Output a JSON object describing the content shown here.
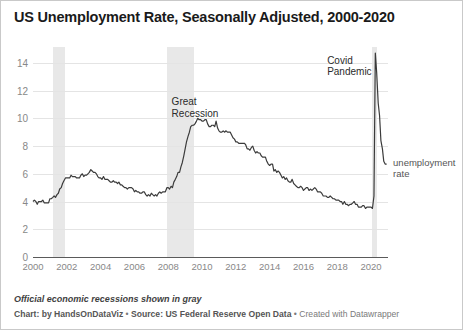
{
  "chart_data": {
    "type": "line",
    "title": "US Unemployment Rate, Seasonally Adjusted, 2000-2020",
    "xlabel": "",
    "ylabel": "",
    "xlim": [
      2000,
      2021.0
    ],
    "ylim": [
      0,
      15
    ],
    "grid": true,
    "legend_position": "right-inline",
    "y_ticks": [
      0,
      2,
      4,
      6,
      8,
      10,
      12,
      14
    ],
    "x_ticks": [
      2000,
      2002,
      2004,
      2006,
      2008,
      2010,
      2012,
      2014,
      2016,
      2018,
      2020
    ],
    "series": [
      {
        "name": "unemployment rate",
        "color": "#3b3b3b",
        "x": [
          2000.0,
          2000.08,
          2000.17,
          2000.25,
          2000.33,
          2000.42,
          2000.5,
          2000.58,
          2000.67,
          2000.75,
          2000.83,
          2000.92,
          2001.0,
          2001.08,
          2001.17,
          2001.25,
          2001.33,
          2001.42,
          2001.5,
          2001.58,
          2001.67,
          2001.75,
          2001.83,
          2001.92,
          2002.0,
          2002.08,
          2002.17,
          2002.25,
          2002.33,
          2002.42,
          2002.5,
          2002.58,
          2002.67,
          2002.75,
          2002.83,
          2002.92,
          2003.0,
          2003.08,
          2003.17,
          2003.25,
          2003.33,
          2003.42,
          2003.5,
          2003.58,
          2003.67,
          2003.75,
          2003.83,
          2003.92,
          2004.0,
          2004.08,
          2004.17,
          2004.25,
          2004.33,
          2004.42,
          2004.5,
          2004.58,
          2004.67,
          2004.75,
          2004.83,
          2004.92,
          2005.0,
          2005.08,
          2005.17,
          2005.25,
          2005.33,
          2005.42,
          2005.5,
          2005.58,
          2005.67,
          2005.75,
          2005.83,
          2005.92,
          2006.0,
          2006.08,
          2006.17,
          2006.25,
          2006.33,
          2006.42,
          2006.5,
          2006.58,
          2006.67,
          2006.75,
          2006.83,
          2006.92,
          2007.0,
          2007.08,
          2007.17,
          2007.25,
          2007.33,
          2007.42,
          2007.5,
          2007.58,
          2007.67,
          2007.75,
          2007.83,
          2007.92,
          2008.0,
          2008.08,
          2008.17,
          2008.25,
          2008.33,
          2008.42,
          2008.5,
          2008.58,
          2008.67,
          2008.75,
          2008.83,
          2008.92,
          2009.0,
          2009.08,
          2009.17,
          2009.25,
          2009.33,
          2009.42,
          2009.5,
          2009.58,
          2009.67,
          2009.75,
          2009.83,
          2009.92,
          2010.0,
          2010.08,
          2010.17,
          2010.25,
          2010.33,
          2010.42,
          2010.5,
          2010.58,
          2010.67,
          2010.75,
          2010.83,
          2010.92,
          2011.0,
          2011.08,
          2011.17,
          2011.25,
          2011.33,
          2011.42,
          2011.5,
          2011.58,
          2011.67,
          2011.75,
          2011.83,
          2011.92,
          2012.0,
          2012.08,
          2012.17,
          2012.25,
          2012.33,
          2012.42,
          2012.5,
          2012.58,
          2012.67,
          2012.75,
          2012.83,
          2012.92,
          2013.0,
          2013.08,
          2013.17,
          2013.25,
          2013.33,
          2013.42,
          2013.5,
          2013.58,
          2013.67,
          2013.75,
          2013.83,
          2013.92,
          2014.0,
          2014.08,
          2014.17,
          2014.25,
          2014.33,
          2014.42,
          2014.5,
          2014.58,
          2014.67,
          2014.75,
          2014.83,
          2014.92,
          2015.0,
          2015.08,
          2015.17,
          2015.25,
          2015.33,
          2015.42,
          2015.5,
          2015.58,
          2015.67,
          2015.75,
          2015.83,
          2015.92,
          2016.0,
          2016.08,
          2016.17,
          2016.25,
          2016.33,
          2016.42,
          2016.5,
          2016.58,
          2016.67,
          2016.75,
          2016.83,
          2016.92,
          2017.0,
          2017.08,
          2017.17,
          2017.25,
          2017.33,
          2017.42,
          2017.5,
          2017.58,
          2017.67,
          2017.75,
          2017.83,
          2017.92,
          2018.0,
          2018.08,
          2018.17,
          2018.25,
          2018.33,
          2018.42,
          2018.5,
          2018.58,
          2018.67,
          2018.75,
          2018.83,
          2018.92,
          2019.0,
          2019.08,
          2019.17,
          2019.25,
          2019.33,
          2019.42,
          2019.5,
          2019.58,
          2019.67,
          2019.75,
          2019.83,
          2019.92,
          2020.0,
          2020.08,
          2020.17,
          2020.25,
          2020.33,
          2020.42,
          2020.5,
          2020.58,
          2020.67,
          2020.75,
          2020.83,
          2020.92
        ],
        "values": [
          4.0,
          4.1,
          4.0,
          3.8,
          4.0,
          4.0,
          4.0,
          4.1,
          3.9,
          3.9,
          3.9,
          3.9,
          4.2,
          4.2,
          4.3,
          4.4,
          4.3,
          4.5,
          4.6,
          4.9,
          5.0,
          5.3,
          5.5,
          5.7,
          5.7,
          5.7,
          5.7,
          5.9,
          5.8,
          5.8,
          5.8,
          5.7,
          5.7,
          5.7,
          5.9,
          6.0,
          5.8,
          5.9,
          5.9,
          6.0,
          6.1,
          6.3,
          6.2,
          6.1,
          6.1,
          6.0,
          5.8,
          5.7,
          5.7,
          5.6,
          5.8,
          5.6,
          5.6,
          5.6,
          5.5,
          5.4,
          5.4,
          5.5,
          5.4,
          5.4,
          5.3,
          5.4,
          5.2,
          5.2,
          5.1,
          5.0,
          5.0,
          4.9,
          5.0,
          5.0,
          5.0,
          4.9,
          4.7,
          4.8,
          4.7,
          4.7,
          4.6,
          4.6,
          4.7,
          4.7,
          4.5,
          4.4,
          4.5,
          4.4,
          4.6,
          4.5,
          4.4,
          4.5,
          4.4,
          4.6,
          4.7,
          4.6,
          4.7,
          4.7,
          4.7,
          5.0,
          5.0,
          4.9,
          5.1,
          5.0,
          5.4,
          5.6,
          5.8,
          6.1,
          6.1,
          6.5,
          6.8,
          7.3,
          7.8,
          8.3,
          8.7,
          9.0,
          9.4,
          9.5,
          9.5,
          9.6,
          9.8,
          10.0,
          9.9,
          9.9,
          9.8,
          9.8,
          9.9,
          9.9,
          9.6,
          9.4,
          9.4,
          9.5,
          9.5,
          9.4,
          9.8,
          9.3,
          9.1,
          9.0,
          9.0,
          9.1,
          9.0,
          9.1,
          9.0,
          9.0,
          9.0,
          8.8,
          8.6,
          8.5,
          8.3,
          8.3,
          8.2,
          8.2,
          8.2,
          8.2,
          8.2,
          8.1,
          7.8,
          7.8,
          7.7,
          7.9,
          8.0,
          7.7,
          7.5,
          7.6,
          7.5,
          7.5,
          7.3,
          7.2,
          7.2,
          7.2,
          6.9,
          6.7,
          6.6,
          6.7,
          6.7,
          6.2,
          6.3,
          6.1,
          6.2,
          6.1,
          5.9,
          5.7,
          5.8,
          5.6,
          5.7,
          5.5,
          5.4,
          5.4,
          5.6,
          5.3,
          5.2,
          5.1,
          5.0,
          5.0,
          5.1,
          5.0,
          4.8,
          4.9,
          5.0,
          5.0,
          4.8,
          4.9,
          4.8,
          4.9,
          5.0,
          4.9,
          4.7,
          4.7,
          4.7,
          4.6,
          4.4,
          4.4,
          4.4,
          4.3,
          4.3,
          4.4,
          4.3,
          4.2,
          4.2,
          4.1,
          4.1,
          4.1,
          4.0,
          4.0,
          3.8,
          4.0,
          3.8,
          3.8,
          3.7,
          3.8,
          3.8,
          3.9,
          4.0,
          3.8,
          3.8,
          3.6,
          3.6,
          3.6,
          3.7,
          3.7,
          3.5,
          3.6,
          3.6,
          3.6,
          3.6,
          3.5,
          4.4,
          14.7,
          13.3,
          11.1,
          10.2,
          8.4,
          7.8,
          6.9,
          6.7,
          6.7
        ]
      }
    ],
    "annotations": [
      {
        "name": "great-recession",
        "text": "Great\nRecession",
        "x": 2008.2,
        "y": 11.6
      },
      {
        "name": "covid-pandemic",
        "text": "Covid\nPandemic",
        "x": 2017.4,
        "y": 14.6
      },
      {
        "name": "series-label",
        "text": "unemployment\nrate",
        "x": 2021.3,
        "y": 7.2
      }
    ],
    "recession_bands": [
      {
        "name": "recession-2001",
        "start": 2001.17,
        "end": 2001.92,
        "color": "#e8e8e8"
      },
      {
        "name": "recession-2008",
        "start": 2007.92,
        "end": 2009.5,
        "color": "#e8e8e8"
      },
      {
        "name": "recession-2020",
        "start": 2020.08,
        "end": 2020.33,
        "color": "#e8e8e8"
      }
    ]
  },
  "footer": {
    "note": "Official economic recessions shown in gray",
    "credit_prefix": "Chart: by HandsOnDataViz",
    "credit_sep1": " • ",
    "credit_source": "Source: US Federal Reserve Open Data",
    "credit_sep2": " • ",
    "credit_tool": "Created with Datawrapper"
  }
}
